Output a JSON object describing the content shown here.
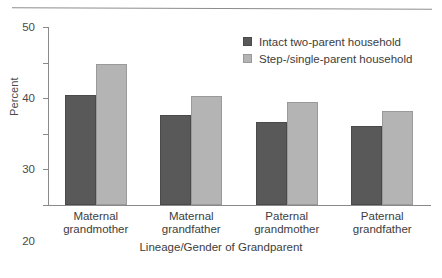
{
  "chart_data": {
    "type": "bar",
    "title": "",
    "xlabel": "Lineage/Gender of Grandparent",
    "ylabel": "Percent",
    "categories": [
      "Maternal grandmother",
      "Maternal grandfather",
      "Paternal grandmother",
      "Paternal grandfather"
    ],
    "category_lines": [
      [
        "Maternal",
        "grandmother"
      ],
      [
        "Maternal",
        "grandfather"
      ],
      [
        "Paternal",
        "grandmother"
      ],
      [
        "Paternal",
        "grandfather"
      ]
    ],
    "series": [
      {
        "name": "Intact two-parent household",
        "color": "#595959",
        "values": [
          31.0,
          25.2,
          23.4,
          22.2
        ]
      },
      {
        "name": "Step-/single-parent household",
        "color": "#b4b4b4",
        "values": [
          39.6,
          30.7,
          28.8,
          26.3
        ]
      }
    ],
    "ylim": [
      0,
      50
    ],
    "yticks": [
      0,
      10,
      20,
      30,
      40,
      50
    ],
    "ytick_labels": [
      "0",
      "10",
      "20",
      "30",
      "40",
      "50"
    ],
    "grid": false,
    "legend_position": "upper right"
  }
}
